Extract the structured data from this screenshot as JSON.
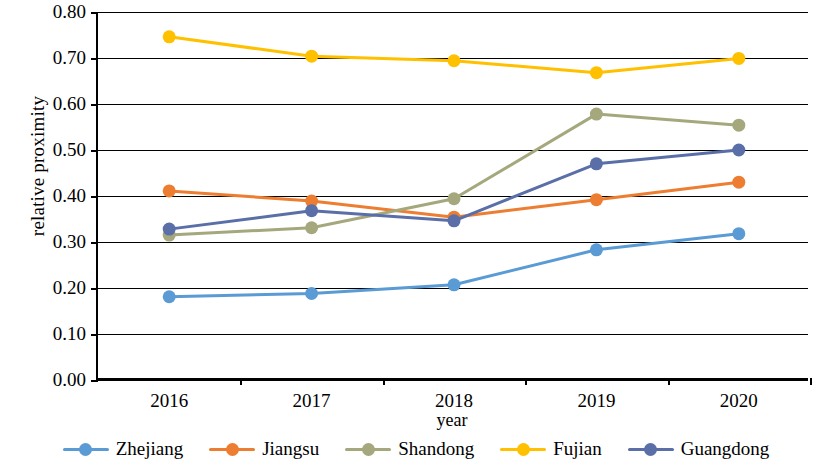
{
  "chart_data": {
    "type": "line",
    "title": "",
    "xlabel": "year",
    "ylabel": "relative proximity",
    "categories": [
      "2016",
      "2017",
      "2018",
      "2019",
      "2020"
    ],
    "ylim": [
      0.0,
      0.8
    ],
    "ytick_labels": [
      "0.00",
      "0.10",
      "0.20",
      "0.30",
      "0.40",
      "0.50",
      "0.60",
      "0.70",
      "0.80"
    ],
    "ytick_values": [
      0.0,
      0.1,
      0.2,
      0.3,
      0.4,
      0.5,
      0.6,
      0.7,
      0.8
    ],
    "grid": true,
    "legend_position": "bottom",
    "series": [
      {
        "name": "Zhejiang",
        "color": "#5b9bd5",
        "values": [
          0.181,
          0.188,
          0.207,
          0.283,
          0.318
        ]
      },
      {
        "name": "Jiangsu",
        "color": "#ed7d31",
        "values": [
          0.411,
          0.389,
          0.354,
          0.392,
          0.43
        ]
      },
      {
        "name": "Shandong",
        "color": "#a5a87c",
        "values": [
          0.315,
          0.331,
          0.394,
          0.578,
          0.554
        ]
      },
      {
        "name": "Fujian",
        "color": "#ffc000",
        "values": [
          0.746,
          0.704,
          0.694,
          0.668,
          0.699
        ]
      },
      {
        "name": "Guangdong",
        "color": "#5a6fa8",
        "values": [
          0.328,
          0.368,
          0.346,
          0.47,
          0.5
        ]
      }
    ]
  }
}
